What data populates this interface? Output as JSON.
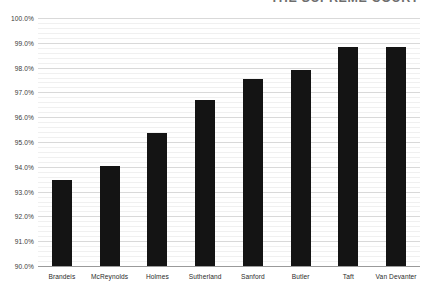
{
  "chart_data": {
    "type": "bar",
    "title": "THE SUPREME COURT",
    "xlabel": "",
    "ylabel": "",
    "categories": [
      "Brandeis",
      "McReynolds",
      "Holmes",
      "Sutherland",
      "Sanford",
      "Butler",
      "Taft",
      "Van Devanter"
    ],
    "values": [
      93.45,
      94.05,
      95.35,
      96.7,
      97.55,
      97.9,
      98.85,
      98.85
    ],
    "ylim": [
      90.0,
      100.0
    ],
    "ytick_labels": [
      "90.0%",
      "91.0%",
      "92.0%",
      "93.0%",
      "94.0%",
      "95.0%",
      "96.0%",
      "97.0%",
      "98.0%",
      "99.0%",
      "100.0%"
    ],
    "ytick_values": [
      90.0,
      91.0,
      92.0,
      93.0,
      94.0,
      95.0,
      96.0,
      97.0,
      98.0,
      99.0,
      100.0
    ],
    "grid": true,
    "minor_grid": true,
    "minor_tick_step": 0.2,
    "legend": "none",
    "bar_color": "#141414",
    "gridline_color": "#d9d9d9",
    "axis_color": "#9a9a9a",
    "background_color": "#ffffff"
  }
}
